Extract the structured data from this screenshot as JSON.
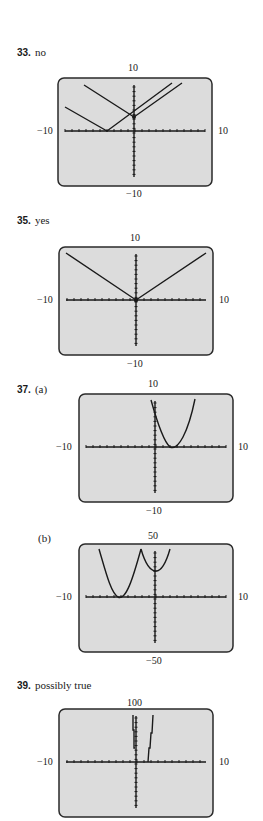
{
  "problems": [
    {
      "number": "33.",
      "answer": "no"
    },
    {
      "number": "35.",
      "answer": "yes"
    },
    {
      "number": "37.",
      "answer": "(a)",
      "sub_b": "(b)"
    },
    {
      "number": "39.",
      "answer": "possibly true"
    }
  ],
  "panels": [
    {
      "id": "p33",
      "ymax": "10",
      "ymin": "-10",
      "xmin": "-10",
      "xmax": "10"
    },
    {
      "id": "p35",
      "ymax": "10",
      "ymin": "-10",
      "xmin": "-10",
      "xmax": "10"
    },
    {
      "id": "p37a",
      "ymax": "10",
      "ymin": "-10",
      "xmin": "-10",
      "xmax": "10"
    },
    {
      "id": "p37b",
      "ymax": "50",
      "ymin": "-50",
      "xmin": "-10",
      "xmax": "10"
    },
    {
      "id": "p39",
      "ymax": "100",
      "ymin": "",
      "xmin": "-10",
      "xmax": "10"
    }
  ],
  "colors": {
    "screen": "#dcdcdc",
    "border": "#2a2a2a",
    "curve": "#1a1a1a"
  },
  "chart_data": [
    {
      "type": "line",
      "title": "33. no",
      "xlim": [
        -10,
        10
      ],
      "ylim": [
        -10,
        10
      ],
      "series": [
        {
          "name": "graph 1",
          "x": [
            -9.5,
            -4,
            6.5
          ],
          "y": [
            6.5,
            0,
            9.5
          ]
        },
        {
          "name": "graph 2",
          "x": [
            -6.5,
            0,
            6.5
          ],
          "y": [
            9.5,
            3,
            9.5
          ]
        }
      ]
    },
    {
      "type": "line",
      "title": "35. yes",
      "xlim": [
        -10,
        10
      ],
      "ylim": [
        -10,
        10
      ],
      "series": [
        {
          "name": "graph",
          "x": [
            -10,
            0,
            10
          ],
          "y": [
            10,
            0,
            10
          ]
        }
      ]
    },
    {
      "type": "line",
      "title": "37. (a)",
      "xlim": [
        -10,
        10
      ],
      "ylim": [
        -10,
        10
      ],
      "series": [
        {
          "name": "parabola",
          "x": [
            -0.5,
            0,
            2.5,
            5,
            6
          ],
          "y": [
            10,
            6,
            0,
            4,
            10
          ]
        }
      ]
    },
    {
      "type": "line",
      "title": "37. (b)",
      "xlim": [
        -10,
        10
      ],
      "ylim": [
        -50,
        50
      ],
      "series": [
        {
          "name": "curve",
          "x": [
            -8,
            -5,
            -2,
            0,
            2
          ],
          "y": [
            50,
            0,
            50,
            27,
            50
          ]
        }
      ]
    },
    {
      "type": "line",
      "title": "39. possibly true",
      "xlim": [
        -10,
        10
      ],
      "ylim": [
        0,
        100
      ],
      "series": [
        {
          "name": "left branch",
          "x": [
            -0.5,
            -0.3
          ],
          "y": [
            100,
            40
          ]
        },
        {
          "name": "right branch",
          "x": [
            4,
            5
          ],
          "y": [
            0,
            100
          ]
        }
      ]
    }
  ]
}
